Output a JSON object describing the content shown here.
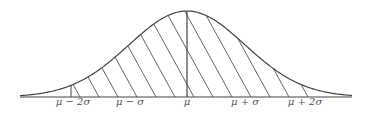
{
  "diagram": {
    "type": "normal-distribution-curve",
    "colors": {
      "stroke": "#444444",
      "hatch": "#555555",
      "background": "#ffffff"
    },
    "axis": {
      "x_start": 20,
      "x_end": 352,
      "baseline_y": 97
    },
    "curve": {
      "mean_x": 187,
      "sigma_px": 58,
      "peak_y": 11
    },
    "hatch": {
      "from_label": "μ − 2σ",
      "to_label": "μ + 2σ",
      "direction": "descending-right"
    },
    "labels": [
      {
        "text": "μ − 2σ",
        "x": 73
      },
      {
        "text": "μ − σ",
        "x": 130
      },
      {
        "text": "μ",
        "x": 187
      },
      {
        "text": "μ + σ",
        "x": 245
      },
      {
        "text": "μ + 2σ",
        "x": 305
      }
    ]
  }
}
